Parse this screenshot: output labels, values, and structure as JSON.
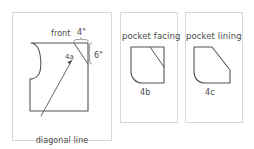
{
  "diagram": {
    "background_color": "#ffffff",
    "panel_border_color": "#d8d8d8",
    "line_color": "#555555",
    "text_color": "#4a4a4a"
  },
  "panels": [
    {
      "id": "front",
      "piece_label": "4a",
      "name_label": "front",
      "dimensions": [
        {
          "label": "4\"",
          "orientation": "horizontal"
        },
        {
          "label": "6\"",
          "orientation": "vertical"
        }
      ],
      "caption_line1": "diagonal line",
      "caption_line2": "for pocket opening"
    },
    {
      "id": "pocket-facing",
      "name_label": "pocket facing",
      "piece_label": "4b"
    },
    {
      "id": "pocket-lining",
      "name_label": "pocket lining",
      "piece_label": "4c"
    }
  ]
}
